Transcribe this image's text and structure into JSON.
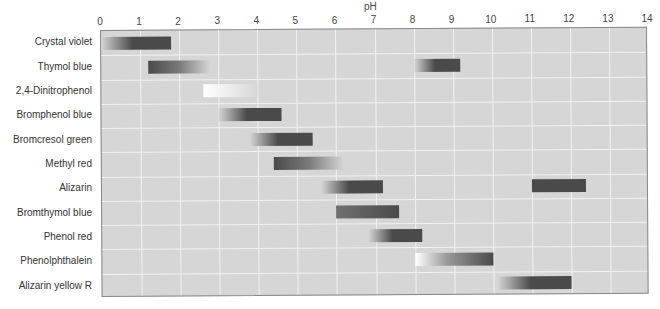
{
  "chart_data": {
    "type": "bar",
    "orientation": "horizontal-range",
    "title": "",
    "xlabel": "pH",
    "ylabel": "",
    "xlim": [
      0,
      14
    ],
    "x_ticks": [
      "0",
      "1",
      "2",
      "3",
      "4",
      "5",
      "6",
      "7",
      "8",
      "9",
      "10",
      "11",
      "12",
      "13",
      "14"
    ],
    "grid": true,
    "legend": null,
    "categories": [
      "Crystal violet",
      "Thymol blue",
      "2,4-Dinitrophenol",
      "Bromphenol blue",
      "Bromcresol green",
      "Methyl red",
      "Alizarin",
      "Bromthymol blue",
      "Phenol red",
      "Phenolphthalein",
      "Alizarin yellow R"
    ],
    "ranges": [
      [
        {
          "start": 0.0,
          "end": 1.8,
          "gradient": "light-to-dark"
        }
      ],
      [
        {
          "start": 1.2,
          "end": 2.8,
          "gradient": "dark-to-light"
        },
        {
          "start": 8.0,
          "end": 9.2,
          "gradient": "light-to-dark"
        }
      ],
      [
        {
          "start": 2.6,
          "end": 4.0,
          "gradient": "white-to-light"
        }
      ],
      [
        {
          "start": 3.0,
          "end": 4.6,
          "gradient": "light-to-dark"
        }
      ],
      [
        {
          "start": 3.8,
          "end": 5.4,
          "gradient": "light-to-dark"
        }
      ],
      [
        {
          "start": 4.4,
          "end": 6.2,
          "gradient": "dark-to-light"
        }
      ],
      [
        {
          "start": 5.6,
          "end": 7.2,
          "gradient": "light-to-dark"
        },
        {
          "start": 11.0,
          "end": 12.4,
          "gradient": "dark"
        }
      ],
      [
        {
          "start": 6.0,
          "end": 7.6,
          "gradient": "medium-to-dark"
        }
      ],
      [
        {
          "start": 6.8,
          "end": 8.2,
          "gradient": "light-to-dark"
        }
      ],
      [
        {
          "start": 8.0,
          "end": 10.0,
          "gradient": "white-to-dark"
        }
      ],
      [
        {
          "start": 10.1,
          "end": 12.0,
          "gradient": "light-to-dark"
        }
      ]
    ]
  },
  "colors": {
    "plot_background": "#d6d6d6",
    "grid": "#f2f2f2",
    "bar_dark": "#4a4a4a",
    "bar_light": "#d6d6d6",
    "bar_white": "#ffffff"
  }
}
